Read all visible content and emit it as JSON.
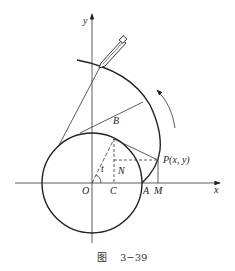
{
  "figure": {
    "caption_prefix": "图",
    "caption_number": "3−39"
  },
  "axes": {
    "x_label": "x",
    "y_label": "y"
  },
  "points": {
    "origin": "O",
    "C": "C",
    "N": "N",
    "A": "A",
    "M": "M",
    "B": "B",
    "P": "P(x, y)",
    "angle": "t"
  },
  "colors": {
    "stroke": "#222222",
    "background": "#ffffff"
  }
}
